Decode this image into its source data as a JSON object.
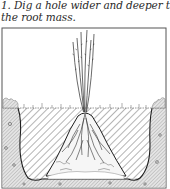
{
  "caption": {
    "line1": "1. Dig a hole wider and deeper than",
    "line2": "the root mass."
  },
  "figure": {
    "elements": [
      "bare-root-plant-stems",
      "root-mass-mound",
      "hatched-hole-cross-section",
      "surrounding-soil",
      "ground-surface-grass"
    ],
    "colors": {
      "ink": "#1e1e1e",
      "frame": "#555555",
      "soil_fill": "#d8d8d8",
      "hatch": "#6a6a6a",
      "paper": "#ffffff"
    }
  }
}
